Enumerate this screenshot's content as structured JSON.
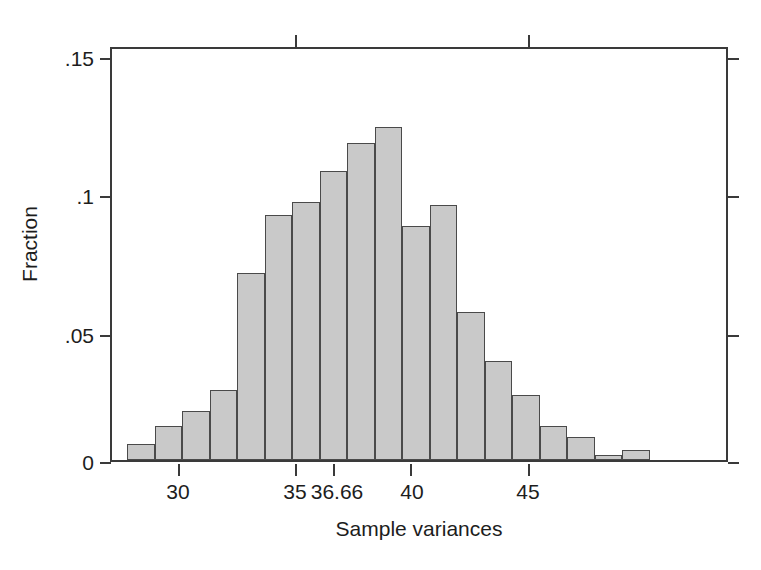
{
  "chart_data": {
    "type": "bar",
    "title": "",
    "subtitle": "",
    "xlabel": "Sample variances",
    "ylabel": "Fraction",
    "grid": false,
    "legend": false,
    "xlim": [
      27.8,
      49.5
    ],
    "ylim": [
      0,
      0.158
    ],
    "x_ticks": [
      30,
      35,
      36.66,
      40,
      45
    ],
    "x_tick_labels": [
      "30",
      "35",
      "36.66",
      "40",
      "45"
    ],
    "y_ticks": [
      0,
      0.05,
      0.1,
      0.15
    ],
    "y_tick_labels": [
      "0",
      ".05",
      ".1",
      ".15"
    ],
    "bin_width": 1.1,
    "bin_starts": [
      28.4,
      29.5,
      30.6,
      31.7,
      32.8,
      33.9,
      35.0,
      36.1,
      37.2,
      38.3,
      39.4,
      40.5,
      41.6,
      42.7,
      43.8,
      44.9,
      46.0,
      47.1,
      48.2
    ],
    "categories": [
      "28.4",
      "29.5",
      "30.6",
      "31.7",
      "32.8",
      "33.9",
      "35.0",
      "36.1",
      "37.2",
      "38.3",
      "39.4",
      "40.5",
      "41.6",
      "42.7",
      "43.8",
      "44.9",
      "46.0",
      "47.1",
      "48.2"
    ],
    "values": [
      0.006,
      0.013,
      0.019,
      0.027,
      0.072,
      0.094,
      0.099,
      0.111,
      0.122,
      0.128,
      0.09,
      0.098,
      0.057,
      0.038,
      0.025,
      0.013,
      0.009,
      0.002,
      0.004
    ],
    "bar_fill_color": "#c9c9c9",
    "bar_edge_color": "#4a4a4a",
    "axis_color": "#3a3a3a",
    "background_color": "#ffffff"
  },
  "axes": {
    "y_title": "Fraction",
    "x_title": "Sample variances",
    "y_tick_labels": [
      ".15",
      ".1",
      ".05",
      "0"
    ],
    "x_tick_labels": [
      "30",
      "35",
      "36.66",
      "40",
      "45"
    ]
  }
}
